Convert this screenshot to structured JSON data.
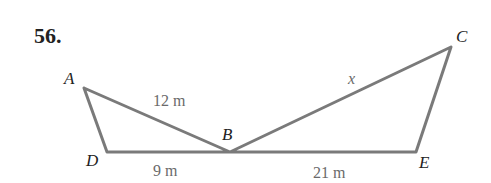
{
  "problem": {
    "number": "56."
  },
  "points": {
    "A": {
      "label": "A",
      "x": 84,
      "y": 88
    },
    "D": {
      "label": "D",
      "x": 107,
      "y": 152
    },
    "B": {
      "label": "B",
      "x": 230,
      "y": 152
    },
    "E": {
      "label": "E",
      "x": 416,
      "y": 152
    },
    "C": {
      "label": "C",
      "x": 451,
      "y": 47
    }
  },
  "segments": [
    {
      "from": "A",
      "to": "B",
      "label": "12 m"
    },
    {
      "from": "D",
      "to": "B",
      "label": "9 m"
    },
    {
      "from": "B",
      "to": "E",
      "label": "21 m"
    },
    {
      "from": "B",
      "to": "C",
      "label": "x"
    },
    {
      "from": "A",
      "to": "D",
      "label": ""
    },
    {
      "from": "C",
      "to": "E",
      "label": ""
    }
  ],
  "labels": {
    "AB": "12 m",
    "DB": "9 m",
    "BE": "21 m",
    "BC": "x"
  },
  "colors": {
    "line": "#7a7a7a",
    "text": "#222222",
    "measure": "#6a6a6a"
  }
}
